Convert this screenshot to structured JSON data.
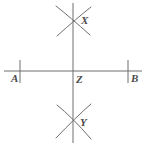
{
  "figure": {
    "stroke_color": "#6e6e6e",
    "label_color": "#4a4a4a",
    "background_color": "#ffffff",
    "width": 146,
    "height": 146
  },
  "labels": {
    "a": "A",
    "b": "B",
    "z": "Z",
    "x": "X",
    "y": "Y"
  },
  "geometry": {
    "horizontal_line": {
      "x1": 4,
      "y1": 71,
      "x2": 142,
      "y2": 71
    },
    "vertical_line": {
      "x1": 73,
      "y1": 3,
      "x2": 73,
      "y2": 143
    },
    "tick_a": {
      "x": 20,
      "y1": 60,
      "y2": 83
    },
    "tick_b": {
      "x": 128,
      "y1": 60,
      "y2": 83
    },
    "point_z": {
      "x": 73,
      "y": 71
    },
    "point_x": {
      "x": 73,
      "y": 22
    },
    "point_y": {
      "x": 73,
      "y": 122
    },
    "arcs_top": [
      {
        "name": "arc-top-from-a",
        "d": "M 56 6 Q 70 17 90 35"
      },
      {
        "name": "arc-top-from-b",
        "d": "M 91 7 Q 77 18 57 36"
      }
    ],
    "arcs_bottom": [
      {
        "name": "arc-bottom-from-a",
        "d": "M 57 105 Q 72 117 91 139"
      },
      {
        "name": "arc-bottom-from-b",
        "d": "M 91 104 Q 76 117 56 138"
      }
    ]
  }
}
